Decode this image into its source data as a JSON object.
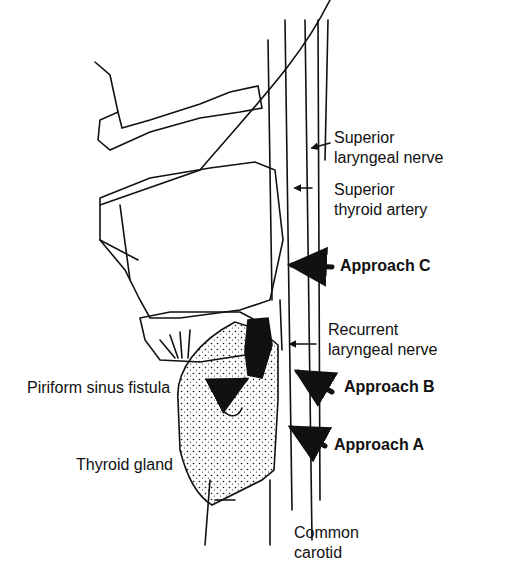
{
  "diagram": {
    "labels": {
      "superior_laryngeal_nerve": [
        "Superior",
        "laryngeal nerve"
      ],
      "superior_thyroid_artery": [
        "Superior",
        "thyroid artery"
      ],
      "approach_c": "Approach C",
      "recurrent_laryngeal_nerve": [
        "Recurrent",
        "laryngeal nerve"
      ],
      "piriform_sinus_fistula": "Piriform sinus fistula",
      "approach_b": "Approach B",
      "approach_a": "Approach A",
      "thyroid_gland": "Thyroid gland",
      "common_carotid": [
        "Common",
        "carotid"
      ]
    },
    "colors": {
      "ink": "#111111",
      "background": "#ffffff"
    }
  }
}
